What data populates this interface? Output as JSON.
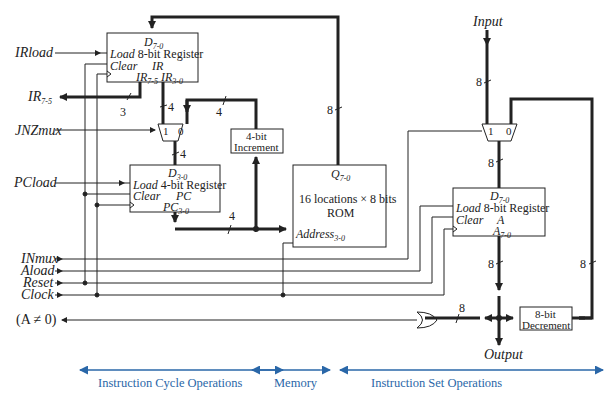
{
  "inputs": {
    "irload": "IRload",
    "ir75_out": "IR",
    "ir75_sub": "7-5",
    "jnzmux": "JNZmux",
    "pcload": "PCload",
    "inmux": "INmux",
    "aload": "Aload",
    "reset": "Reset",
    "clock": "Clock",
    "anz": "(A ≠ 0)",
    "input": "Input",
    "output": "Output"
  },
  "ir_register": {
    "d": "D",
    "d_sub": "7-0",
    "load": "Load",
    "title": "8-bit Register",
    "clear": "Clear",
    "name": "IR",
    "q1": "IR",
    "q1_sub": "7-5",
    "q2": "IR",
    "q2_sub": "3-0"
  },
  "pc_register": {
    "d": "D",
    "d_sub": "3-0",
    "load": "Load",
    "title": "4-bit Register",
    "clear": "Clear",
    "name": "PC",
    "q": "PC",
    "q_sub": "3-0"
  },
  "a_register": {
    "d": "D",
    "d_sub": "7-0",
    "load": "Load",
    "title": "8-bit Register",
    "clear": "Clear",
    "name": "A",
    "q": "A",
    "q_sub": "7-0"
  },
  "rom": {
    "q": "Q",
    "q_sub": "7-0",
    "line1": "16 locations × 8 bits",
    "line2": "ROM",
    "addr": "Address",
    "addr_sub": "3-0"
  },
  "increment": {
    "line1": "4-bit",
    "line2": "Increment"
  },
  "decrement": {
    "line1": "8-bit",
    "line2": "Decrement"
  },
  "mux": {
    "in1": "1",
    "in0": "0"
  },
  "bus_widths": {
    "w3": "3",
    "w4": "4",
    "w8": "8"
  },
  "sections": {
    "cycle": "Instruction Cycle Operations",
    "memory": "Memory",
    "set": "Instruction Set Operations"
  },
  "colors": {
    "line": "#222222",
    "accent": "#2a67a8"
  }
}
